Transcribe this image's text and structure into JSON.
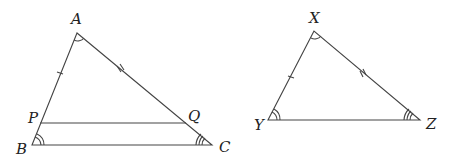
{
  "figure": {
    "triangle_abc": {
      "vertices": {
        "A": "A",
        "B": "B",
        "C": "C"
      },
      "points": {
        "P": "P",
        "Q": "Q"
      },
      "segments": [
        "AB",
        "AC",
        "BC",
        "PQ"
      ],
      "marks": {
        "AP": "single tick",
        "AQ": "double tick",
        "angle_A": "single arc",
        "angle_B": "double arc",
        "angle_C": "triple arc"
      }
    },
    "triangle_xyz": {
      "vertices": {
        "X": "X",
        "Y": "Y",
        "Z": "Z"
      },
      "segments": [
        "XY",
        "XZ",
        "YZ"
      ],
      "marks": {
        "XY": "single tick",
        "XZ": "double tick",
        "angle_X": "single arc",
        "angle_Y": "double arc",
        "angle_Z": "triple arc"
      }
    }
  },
  "colors": {
    "stroke": "#333333",
    "background": "#ffffff"
  }
}
